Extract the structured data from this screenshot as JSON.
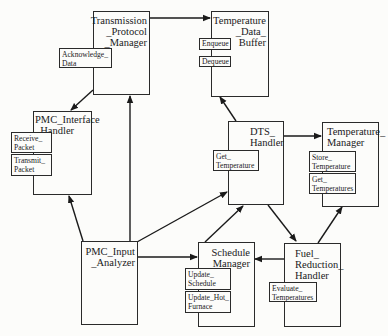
{
  "diagram": {
    "modules": [
      {
        "id": "tpm",
        "title": "Transmission\n_Protocol\n_Manager",
        "operations": [
          "Acknowledge_\nData"
        ]
      },
      {
        "id": "tdb",
        "title": "Temperature\n_Data_\nBuffer",
        "operations": [
          "Enqueue",
          "Dequeue"
        ]
      },
      {
        "id": "pih",
        "title": "PMC_Interface\n_Handler",
        "operations": [
          "Receive_\nPacket",
          "Transmit_\nPacket"
        ]
      },
      {
        "id": "dts",
        "title": "DTS_\nHandler",
        "operations": [
          "Get_\nTemperature"
        ]
      },
      {
        "id": "tm",
        "title": "Temperature_\nManager",
        "operations": [
          "Store_\nTemperature",
          "Get_\nTemperatures"
        ]
      },
      {
        "id": "pia",
        "title": "PMC_Input\n_Analyzer",
        "operations": []
      },
      {
        "id": "sm",
        "title": "Schedule\n_Manager",
        "operations": [
          "Update_\nSchedule",
          "Update_Hot_\nFurnace"
        ]
      },
      {
        "id": "frh",
        "title": "Fuel_\nReduction_\nHandler",
        "operations": [
          "Evaluate_\nTemperatures"
        ]
      }
    ],
    "edges": [
      {
        "from": "Transmission_Protocol_Manager",
        "to": "Temperature_Data_Buffer"
      },
      {
        "from": "Transmission_Protocol_Manager",
        "to": "PMC_Interface_Handler"
      },
      {
        "from": "PMC_Input_Analyzer",
        "to": "PMC_Interface_Handler"
      },
      {
        "from": "PMC_Input_Analyzer",
        "to": "Transmission_Protocol_Manager"
      },
      {
        "from": "PMC_Input_Analyzer",
        "to": "DTS_Handler"
      },
      {
        "from": "PMC_Input_Analyzer",
        "to": "Schedule_Manager"
      },
      {
        "from": "DTS_Handler",
        "to": "Temperature_Data_Buffer"
      },
      {
        "from": "DTS_Handler",
        "to": "Temperature_Manager"
      },
      {
        "from": "DTS_Handler",
        "to": "Fuel_Reduction_Handler"
      },
      {
        "from": "Schedule_Manager",
        "to": "DTS_Handler"
      },
      {
        "from": "Fuel_Reduction_Handler",
        "to": "Schedule_Manager"
      },
      {
        "from": "Fuel_Reduction_Handler",
        "to": "Temperature_Manager"
      }
    ]
  }
}
